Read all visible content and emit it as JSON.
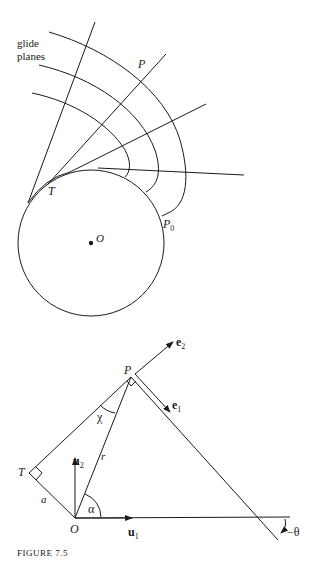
{
  "figure": {
    "caption": "FIGURE 7.5"
  },
  "top_diagram": {
    "glide_label_line1": "glide",
    "glide_label_line2": "planes",
    "point_P": "P",
    "point_T": "T",
    "point_O": "O",
    "point_P0_main": "P",
    "point_P0_sub": "0"
  },
  "bottom_diagram": {
    "point_P": "P",
    "point_T": "T",
    "point_O": "O",
    "length_a": "a",
    "length_r": "r",
    "angle_chi": "χ",
    "angle_alpha": "α",
    "angle_theta": "−θ",
    "vec_u1_main": "u",
    "vec_u1_sub": "1",
    "vec_u2_main": "u",
    "vec_u2_sub": "2",
    "vec_e1_main": "e",
    "vec_e1_sub": "1",
    "vec_e2_main": "e",
    "vec_e2_sub": "2"
  }
}
